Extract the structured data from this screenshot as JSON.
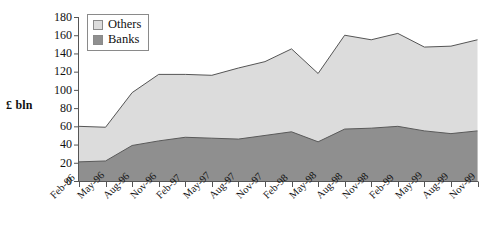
{
  "chart_data": {
    "type": "area",
    "stacked": true,
    "title": "",
    "subtitle": "",
    "xlabel": "",
    "ylabel": "£ bln",
    "ylim": [
      0,
      180
    ],
    "ytick_step": 20,
    "yticks": [
      180,
      160,
      140,
      120,
      100,
      80,
      60,
      40,
      20,
      0
    ],
    "grid": false,
    "legend_position": "top-left",
    "categories": [
      "Feb-96",
      "May-96",
      "Aug-96",
      "Nov-96",
      "Feb-97",
      "May-97",
      "Aug-97",
      "Nov-97",
      "Feb-98",
      "May-98",
      "Aug-98",
      "Nov-98",
      "Feb-99",
      "May-99",
      "Aug-99",
      "Nov-99"
    ],
    "series": [
      {
        "name": "Banks",
        "color": "#8f8f8f",
        "values": [
          21,
          22,
          39,
          44,
          48,
          47,
          46,
          50,
          54,
          43,
          57,
          58,
          60,
          55,
          52,
          55
        ]
      },
      {
        "name": "Others",
        "color": "#dcdcdc",
        "values": [
          39,
          37,
          58,
          73,
          69,
          69,
          78,
          81,
          91,
          75,
          103,
          97,
          102,
          92,
          96,
          100
        ]
      }
    ],
    "totals": [
      60,
      59,
      97,
      117,
      117,
      116,
      124,
      131,
      145,
      118,
      160,
      155,
      162,
      147,
      148,
      155
    ],
    "legend": [
      "Others",
      "Banks"
    ]
  },
  "colors": {
    "others_fill": "#dcdcdc",
    "banks_fill": "#8f8f8f",
    "line": "#555555",
    "axis": "#555555",
    "text": "#111111"
  }
}
